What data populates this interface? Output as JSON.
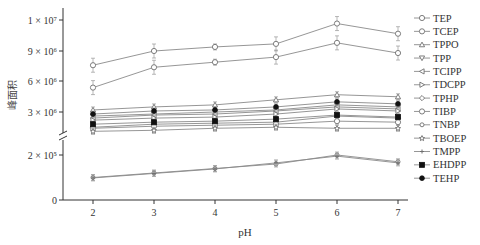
{
  "chart_data": {
    "type": "line",
    "title": "",
    "xlabel": "pH",
    "ylabel": "峰面积",
    "x": [
      2,
      3,
      4,
      5,
      6,
      7
    ],
    "x_tick_labels": [
      "2",
      "3",
      "4",
      "5",
      "6",
      "7"
    ],
    "y_axis": {
      "broken": true,
      "lower_segment": {
        "range": [
          0,
          250000
        ],
        "tick_labels": [
          "0",
          "2 × 10⁵"
        ],
        "tick_values": [
          0,
          200000
        ]
      },
      "upper_segment": {
        "range": [
          2300000,
          12000000
        ],
        "tick_labels": [
          "3 × 10⁶",
          "6 × 10⁶",
          "9 × 10⁶",
          "1 × 10⁷"
        ],
        "tick_values": [
          3000000,
          6000000,
          9000000,
          12000000
        ]
      }
    },
    "grid": false,
    "legend_position": "right",
    "error_bars": true,
    "series": [
      {
        "name": "TEP",
        "marker": "circle-open",
        "values": [
          5400000,
          7400000,
          7900000,
          8400000,
          9800000,
          8800000
        ]
      },
      {
        "name": "TCEP",
        "marker": "circle-open",
        "values": [
          7600000,
          9000000,
          9400000,
          9700000,
          11700000,
          10700000
        ]
      },
      {
        "name": "TPPO",
        "marker": "triangle-up-open",
        "values": [
          3200000,
          3500000,
          3700000,
          4200000,
          4700000,
          4500000
        ]
      },
      {
        "name": "TPP",
        "marker": "triangle-down-open",
        "values": [
          2600000,
          2800000,
          3000000,
          3200000,
          3700000,
          3500000
        ]
      },
      {
        "name": "TCIPP",
        "marker": "triangle-left-open",
        "values": [
          2400000,
          2700000,
          2800000,
          3100000,
          3500000,
          3300000
        ]
      },
      {
        "name": "TDCPP",
        "marker": "triangle-right-open",
        "values": [
          2200000,
          2400000,
          2500000,
          2800000,
          3300000,
          3100000
        ]
      },
      {
        "name": "TPHP",
        "marker": "diamond-open",
        "values": [
          1500000,
          1800000,
          1900000,
          2000000,
          2600000,
          2400000
        ]
      },
      {
        "name": "TIBP",
        "marker": "circle-open",
        "values": [
          1400000,
          1600000,
          1700000,
          1800000,
          2100000,
          2000000
        ]
      },
      {
        "name": "TNBP",
        "marker": "circle-open-small",
        "lower": true,
        "values": [
          100000,
          120000,
          140000,
          160000,
          200000,
          170000
        ]
      },
      {
        "name": "TBOEP",
        "marker": "star",
        "values": [
          1100000,
          1200000,
          1400000,
          1500000,
          1400000,
          1400000
        ]
      },
      {
        "name": "TMPP",
        "marker": "plus",
        "lower": true,
        "values": [
          98000,
          118000,
          138000,
          165000,
          195000,
          165000
        ]
      },
      {
        "name": "EHDPP",
        "marker": "square-filled",
        "values": [
          1800000,
          2000000,
          2100000,
          2300000,
          2700000,
          2500000
        ]
      },
      {
        "name": "TEHP",
        "marker": "circle-filled",
        "values": [
          2800000,
          3100000,
          3200000,
          3500000,
          4000000,
          3800000
        ]
      }
    ]
  },
  "axes": {
    "xlabel": "pH",
    "ylabel": "峰面积",
    "x_ticks": [
      "2",
      "3",
      "4",
      "5",
      "6",
      "7"
    ],
    "y_ticks_upper": [
      "1 × 10⁷",
      "9 × 10⁶",
      "6 × 10⁶",
      "3 × 10⁶"
    ],
    "y_ticks_lower": [
      "2 × 10⁵",
      "0"
    ]
  },
  "legend": {
    "items": [
      "TEP",
      "TCEP",
      "TPPO",
      "TPP",
      "TCIPP",
      "TDCPP",
      "TPHP",
      "TIBP",
      "TNBP",
      "TBOEP",
      "TMPP",
      "EHDPP",
      "TEHP"
    ]
  },
  "colors": {
    "line": "#8a8a8a",
    "axis": "#333333",
    "marker_fill_dark": "#111111"
  }
}
